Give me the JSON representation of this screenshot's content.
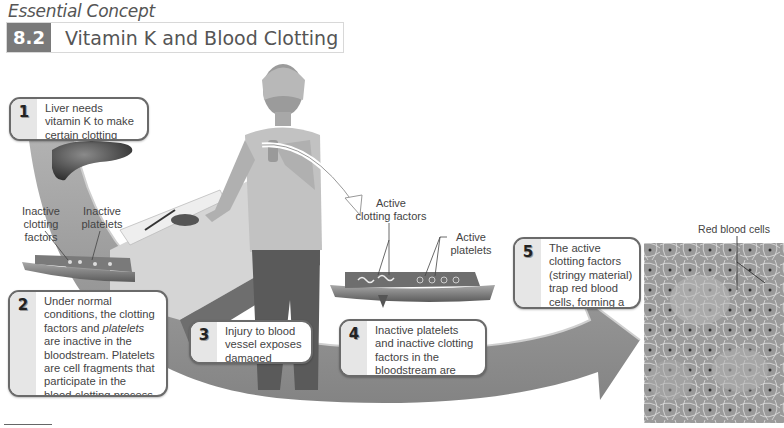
{
  "header": {
    "eyebrow": "Essential Concept",
    "section_number": "8.2",
    "title": "Vitamin K and Blood Clotting"
  },
  "steps": [
    {
      "number": "1",
      "text": "Liver needs vitamin K to make certain clotting factors."
    },
    {
      "number": "2",
      "text_parts": [
        "Under normal conditions, the clotting factors and ",
        "platelets",
        " are inactive in the bloodstream. Platelets are cell fragments that participate in the blood-clotting process."
      ]
    },
    {
      "number": "3",
      "text": "Injury to blood vessel exposes damaged tissues."
    },
    {
      "number": "4",
      "text": "Inactive platelets and inactive clotting factors in the bloodstream are activated."
    },
    {
      "number": "5",
      "text": "The active clotting factors (stringy material) trap red blood cells, forming a clot."
    }
  ],
  "labels": {
    "inactive_clotting_factors": [
      "Inactive",
      "clotting factors"
    ],
    "inactive_platelets": [
      "Inactive",
      "platelets"
    ],
    "active_clotting_factors": [
      "Active",
      "clotting factors"
    ],
    "active_platelets": [
      "Active",
      "platelets"
    ],
    "red_blood_cells": "Red blood cells"
  },
  "illustrations": {
    "liver": "liver",
    "person": "woman cutting finger with knife at kitchen counter",
    "vessel_before": "blood vessel with inactive factors",
    "vessel_after": "injured blood vessel with active factors",
    "micrograph": "electron micrograph of blood clot"
  },
  "colors": {
    "title_badge": "#7a7a7a",
    "box_border": "#6a6a6a",
    "box_number_panel": "#e6e6e6",
    "flow_arrow": "#8a8a8a"
  }
}
